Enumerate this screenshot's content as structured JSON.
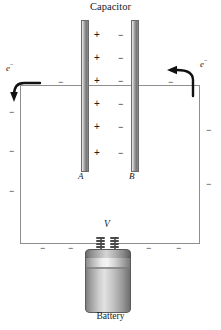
{
  "figure": {
    "title": "Capacitor",
    "battery_label": "Battery",
    "plate_a_label": "A",
    "plate_b_label": "B",
    "voltage_label": "V",
    "electron_label_left": "e",
    "electron_label_left_sup": "−",
    "electron_label_right": "e",
    "electron_label_right_sup": "−",
    "plus_sign": "+",
    "minus_sign": "−",
    "colors": {
      "wire": "#8e8e8e",
      "plate_outline": "#6b6b6b",
      "text": "#1a1a1a",
      "arrow": "#111111",
      "battery_outline": "#5c5c5c"
    },
    "plate_a_charges": [
      "+",
      "+",
      "+",
      "+",
      "+",
      "+"
    ],
    "plate_b_charges": [
      "−",
      "−",
      "−",
      "−",
      "−",
      "−"
    ],
    "wire_charges_top": [
      "−",
      "−"
    ],
    "wire_charges_left": [
      "−",
      "−",
      "−"
    ],
    "wire_charges_right": [
      "−",
      "−"
    ],
    "wire_charges_bottom": [
      "−",
      "−",
      "−",
      "−"
    ]
  }
}
